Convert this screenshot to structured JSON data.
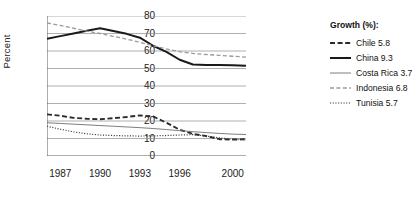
{
  "chart_data": {
    "type": "line",
    "title": "",
    "xlabel": "",
    "ylabel": "Percent",
    "xlim": [
      1986,
      2001
    ],
    "ylim": [
      0,
      80
    ],
    "yticks": [
      80,
      70,
      60,
      50,
      40,
      30,
      20,
      10,
      0
    ],
    "xticks": [
      1987,
      1990,
      1993,
      1996,
      2000
    ],
    "grid": true,
    "legend_position": "right",
    "legend_title": "Growth (%):",
    "x": [
      1986,
      1987,
      1988,
      1989,
      1990,
      1991,
      1992,
      1993,
      1994,
      1995,
      1996,
      1997,
      1998,
      1999,
      2000,
      2001
    ],
    "series": [
      {
        "name": "Chile",
        "growth": 5.8,
        "label": "Chile 5.8",
        "style": "dashed",
        "color": "#2b2b2b",
        "width": 1.9,
        "values": [
          23.8,
          23.0,
          21.8,
          21.3,
          21.0,
          21.6,
          22.3,
          23.2,
          22.6,
          19.0,
          15.0,
          12.6,
          11.4,
          9.6,
          9.4,
          9.6
        ]
      },
      {
        "name": "China",
        "growth": 9.3,
        "label": "China 9.3",
        "style": "solid-thick",
        "color": "#1a1a1a",
        "width": 2.0,
        "values": [
          67.0,
          68.5,
          70.0,
          71.6,
          73.0,
          71.4,
          69.8,
          67.6,
          63.0,
          59.5,
          55.0,
          52.3,
          52.0,
          52.0,
          51.9,
          51.6
        ]
      },
      {
        "name": "Costa Rica",
        "growth": 3.7,
        "label": "Costa Rica 3.7",
        "style": "solid-thin",
        "color": "#6e6e6e",
        "width": 0.9,
        "values": [
          19.0,
          18.6,
          18.2,
          17.8,
          17.4,
          17.0,
          16.6,
          16.2,
          15.7,
          15.1,
          14.5,
          13.9,
          13.4,
          12.9,
          12.5,
          12.3
        ]
      },
      {
        "name": "Indonesia",
        "growth": 6.8,
        "label": "Indonesia 6.8",
        "style": "dashed-light",
        "color": "#9a9a9a",
        "width": 1.3,
        "values": [
          76.0,
          74.6,
          73.0,
          71.4,
          70.0,
          68.4,
          66.8,
          65.0,
          63.0,
          61.2,
          59.6,
          58.6,
          58.0,
          57.5,
          57.0,
          56.5
        ]
      },
      {
        "name": "Tunisia",
        "growth": 5.7,
        "label": "Tunisia 5.7",
        "style": "dotted",
        "color": "#3a3a3a",
        "width": 1.2,
        "values": [
          17.0,
          15.3,
          13.8,
          12.7,
          12.0,
          11.7,
          11.5,
          11.4,
          11.5,
          11.7,
          12.0,
          12.2,
          11.4,
          10.4,
          9.6,
          9.2
        ]
      }
    ]
  },
  "axis": {
    "y_title": "Percent",
    "y_labels": [
      "80",
      "70",
      "60",
      "50",
      "40",
      "30",
      "20",
      "10",
      "0"
    ],
    "x_labels": [
      "1987",
      "1990",
      "1993",
      "1996",
      "2000"
    ]
  },
  "legend": {
    "title": "Growth (%):",
    "items": [
      {
        "label": "Chile 5.8"
      },
      {
        "label": "China 9.3"
      },
      {
        "label": "Costa Rica 3.7"
      },
      {
        "label": "Indonesia 6.8"
      },
      {
        "label": "Tunisia 5.7"
      }
    ]
  },
  "colors": {
    "grid": "#8d8d8d",
    "axis": "#5a5a5a",
    "text": "#1a1a1a"
  }
}
